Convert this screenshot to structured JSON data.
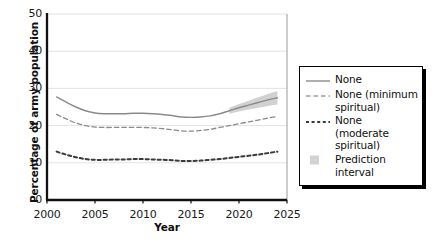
{
  "chart_data": {
    "type": "line",
    "title": "",
    "xlabel": "Year",
    "ylabel": "Percentage of army population",
    "xlim": [
      2000,
      2025
    ],
    "ylim": [
      0,
      50
    ],
    "xticks": [
      2000,
      2005,
      2010,
      2015,
      2020,
      2025
    ],
    "yticks": [
      0,
      10,
      20,
      30,
      40,
      50
    ],
    "grid": "horizontal",
    "legend_position": "right",
    "x": [
      2001,
      2002,
      2003,
      2004,
      2005,
      2006,
      2007,
      2008,
      2009,
      2010,
      2011,
      2012,
      2013,
      2014,
      2015,
      2016,
      2017,
      2018,
      2019,
      2020,
      2021,
      2022,
      2023,
      2024
    ],
    "series": [
      {
        "name": "None",
        "style": "solid",
        "color": "#8a8a8a",
        "values": [
          27.7,
          26.3,
          25.0,
          24.0,
          23.4,
          23.2,
          23.2,
          23.2,
          23.3,
          23.3,
          23.2,
          23.0,
          22.7,
          22.3,
          22.2,
          22.3,
          22.6,
          23.2,
          24.0,
          24.8,
          25.5,
          26.2,
          26.9,
          27.5
        ]
      },
      {
        "name": "None (minimum spiritual)",
        "style": "dashed",
        "color": "#8a8a8a",
        "values": [
          23.0,
          21.8,
          20.7,
          20.0,
          19.6,
          19.5,
          19.5,
          19.5,
          19.5,
          19.5,
          19.4,
          19.2,
          18.9,
          18.6,
          18.5,
          18.7,
          19.0,
          19.5,
          20.0,
          20.5,
          21.0,
          21.5,
          22.0,
          22.5
        ]
      },
      {
        "name": "None (moderate spiritual)",
        "style": "dashed-bold",
        "color": "#3a3a3a",
        "values": [
          13.0,
          12.2,
          11.5,
          11.0,
          10.8,
          10.8,
          10.9,
          10.9,
          11.0,
          11.0,
          10.9,
          10.8,
          10.7,
          10.5,
          10.5,
          10.6,
          10.8,
          11.0,
          11.3,
          11.6,
          11.9,
          12.2,
          12.6,
          13.0
        ]
      }
    ],
    "prediction_interval": {
      "label": "Prediction interval",
      "series": "None",
      "color": "#c9c9c9",
      "x": [
        2019,
        2020,
        2021,
        2022,
        2023,
        2024
      ],
      "lower": [
        23.2,
        23.8,
        24.3,
        24.8,
        25.3,
        25.7
      ],
      "upper": [
        24.8,
        25.8,
        26.7,
        27.6,
        28.5,
        29.3
      ]
    }
  },
  "axes": {
    "ylabel": "Percentage of army population",
    "xlabel": "Year",
    "yticks": [
      "50",
      "40",
      "30",
      "20",
      "10",
      "0"
    ],
    "xticks": [
      "2000",
      "2005",
      "2010",
      "2015",
      "2020",
      "2025"
    ]
  },
  "legend": {
    "items": [
      {
        "label": "None",
        "key": "line-solid"
      },
      {
        "label": "None (minimum\nspiritual)",
        "key": "line-dashed"
      },
      {
        "label": "None (moderate\nspiritual)",
        "key": "line-dashed-bold"
      },
      {
        "label": "Prediction interval",
        "key": "swatch-band"
      }
    ]
  }
}
